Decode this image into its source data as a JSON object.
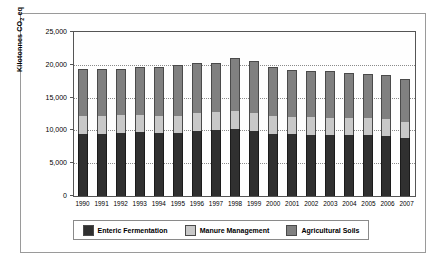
{
  "chart_data": {
    "type": "bar",
    "subtype": "stacked-column",
    "title": "",
    "xlabel": "",
    "ylabel": "Kilotonnes CO2 eq",
    "ylabel_parts": {
      "pre": "Kilotonnes CO",
      "sub": "2",
      "post": " eq"
    },
    "ylim": [
      0,
      25000
    ],
    "yticks": [
      0,
      5000,
      10000,
      15000,
      20000,
      25000
    ],
    "ytick_labels": [
      "0",
      "5,000",
      "10,000",
      "15,000",
      "20,000",
      "25,000"
    ],
    "grid": true,
    "grid_style": "dotted-horizontal",
    "legend_position": "bottom",
    "categories": [
      "1990",
      "1991",
      "1992",
      "1993",
      "1994",
      "1995",
      "1996",
      "1997",
      "1998",
      "1999",
      "2000",
      "2001",
      "2002",
      "2003",
      "2004",
      "2005",
      "2006",
      "2007"
    ],
    "series": [
      {
        "name": "Enteric Fermentation",
        "color": "#303030",
        "values": [
          9500,
          9520,
          9580,
          9700,
          9600,
          9600,
          9880,
          10080,
          10220,
          9880,
          9500,
          9400,
          9350,
          9300,
          9250,
          9250,
          9100,
          8850
        ]
      },
      {
        "name": "Manure Management",
        "color": "#c8c8c8",
        "values": [
          2700,
          2750,
          2800,
          2700,
          2650,
          2650,
          2750,
          2800,
          2700,
          2850,
          2650,
          2600,
          2650,
          2650,
          2650,
          2700,
          2650,
          2400
        ]
      },
      {
        "name": "Agricultural Soils",
        "color": "#808080",
        "values": [
          7100,
          7130,
          7020,
          7200,
          7450,
          7750,
          7620,
          7420,
          8080,
          7870,
          7450,
          7200,
          7000,
          7050,
          6900,
          6650,
          6750,
          6550
        ]
      }
    ],
    "totals": [
      19300,
      19400,
      19400,
      19600,
      19700,
      20000,
      20250,
      20300,
      21000,
      20600,
      19600,
      19200,
      19000,
      19000,
      18800,
      18600,
      18500,
      17800
    ]
  },
  "legend": {
    "items": [
      {
        "label": "Enteric Fermentation",
        "color": "#303030"
      },
      {
        "label": "Manure Management",
        "color": "#c8c8c8"
      },
      {
        "label": "Agricultural Soils",
        "color": "#808080"
      }
    ]
  }
}
